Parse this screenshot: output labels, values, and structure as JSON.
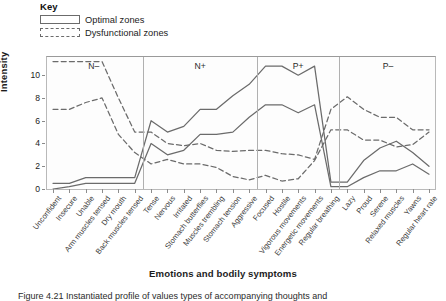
{
  "key": {
    "title": "Key",
    "items": [
      {
        "label": "Optimal zones",
        "style": "solid"
      },
      {
        "label": "Dysfunctional zones",
        "style": "dashed"
      }
    ]
  },
  "axis": {
    "ylabel": "Intensity",
    "xlabel": "Emotions and bodily symptoms",
    "yticks": [
      0,
      2,
      4,
      6,
      8,
      10
    ],
    "ylim": [
      0,
      11.6
    ]
  },
  "caption": "Figure 4.21 Instantiated profile of values types of accompanying thoughts and",
  "zones": [
    {
      "name": "N–",
      "start": 0,
      "end": 5
    },
    {
      "name": "N+",
      "start": 6,
      "end": 12
    },
    {
      "name": "P+",
      "start": 13,
      "end": 17
    },
    {
      "name": "P–",
      "start": 18,
      "end": 23
    }
  ],
  "chart_data": {
    "type": "line",
    "title": "",
    "xlabel": "Emotions and bodily symptoms",
    "ylabel": "Intensity",
    "ylim": [
      0,
      11.6
    ],
    "grid": false,
    "legend_position": "top-left",
    "categories": [
      "Unconfident",
      "Insecure",
      "Unable",
      "Arm muscles tensed",
      "Dry mouth",
      "Back muscles tensed",
      "Tense",
      "Nervous",
      "Irritated",
      "Stomach butterflies",
      "Muscles trembling",
      "Stomach tension",
      "Aggressive",
      "Focused",
      "Hostile",
      "Vigorous movements",
      "Energetic movements",
      "Regular breathing",
      "Lazy",
      "Proud",
      "Serene",
      "Relaxed muscles",
      "Yawns",
      "Regular heart rate"
    ],
    "series": [
      {
        "name": "Optimal zone upper",
        "style": "solid",
        "color": "#6b6b6b",
        "values": [
          0.5,
          0.5,
          1.0,
          1.0,
          1.0,
          1.0,
          6.0,
          5.0,
          5.5,
          7.0,
          7.0,
          8.2,
          9.2,
          10.8,
          10.8,
          10.0,
          10.8,
          0.6,
          0.6,
          2.5,
          3.6,
          4.2,
          3.2,
          2.0
        ]
      },
      {
        "name": "Optimal zone lower",
        "style": "solid",
        "color": "#6b6b6b",
        "values": [
          0.0,
          0.2,
          0.5,
          0.5,
          0.5,
          0.5,
          4.0,
          3.0,
          3.4,
          4.8,
          4.8,
          5.0,
          6.3,
          7.4,
          7.4,
          6.7,
          7.4,
          0.2,
          0.2,
          1.0,
          1.6,
          1.6,
          2.2,
          1.3
        ]
      },
      {
        "name": "Dysfunctional zone upper",
        "style": "dashed",
        "color": "#6b6b6b",
        "values": [
          11.2,
          11.2,
          11.2,
          11.2,
          8.0,
          5.0,
          5.0,
          4.0,
          3.8,
          4.0,
          3.4,
          3.3,
          3.4,
          3.4,
          3.1,
          3.0,
          2.6,
          7.0,
          8.1,
          7.0,
          6.3,
          6.3,
          5.2,
          5.2
        ]
      },
      {
        "name": "Dysfunctional zone lower",
        "style": "dashed",
        "color": "#6b6b6b",
        "values": [
          7.0,
          7.0,
          7.6,
          8.0,
          4.8,
          3.2,
          2.2,
          2.6,
          2.2,
          2.2,
          1.9,
          1.1,
          0.8,
          1.2,
          0.7,
          0.9,
          2.5,
          5.2,
          5.2,
          4.3,
          4.3,
          3.7,
          3.9,
          5.0
        ]
      }
    ]
  }
}
